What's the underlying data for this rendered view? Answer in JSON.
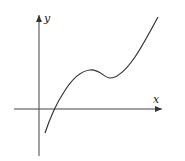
{
  "diagram": {
    "type": "function-graph",
    "axes": {
      "x_label": "x",
      "y_label": "y"
    },
    "curve": {
      "description": "cubic-like curve rising from below x-axis, crossing x-axis just right of origin, local maximum, local minimum, then rising steeply",
      "features": [
        "x-intercept right of origin",
        "local maximum",
        "local minimum",
        "increasing end"
      ]
    },
    "colors": {
      "stroke": "#333333",
      "background": "#ffffff"
    }
  }
}
